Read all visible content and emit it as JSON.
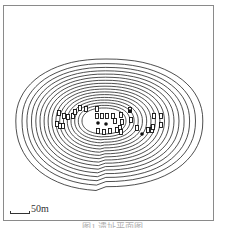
{
  "map": {
    "type": "contour-site-plan",
    "contour_color": "#222222",
    "contour_count": 17,
    "center": [
      104,
      121
    ],
    "outer_radius": [
      94,
      62
    ],
    "inner_radius": [
      22,
      13
    ],
    "markers": [
      {
        "x": 59,
        "y": 113
      },
      {
        "x": 64,
        "y": 116
      },
      {
        "x": 68,
        "y": 117
      },
      {
        "x": 73,
        "y": 116
      },
      {
        "x": 75,
        "y": 112
      },
      {
        "x": 80,
        "y": 108
      },
      {
        "x": 86,
        "y": 109
      },
      {
        "x": 57,
        "y": 124
      },
      {
        "x": 60,
        "y": 126
      },
      {
        "x": 63,
        "y": 126
      },
      {
        "x": 97,
        "y": 109
      },
      {
        "x": 97,
        "y": 116
      },
      {
        "x": 102,
        "y": 116
      },
      {
        "x": 107,
        "y": 116
      },
      {
        "x": 113,
        "y": 116
      },
      {
        "x": 115,
        "y": 121
      },
      {
        "x": 121,
        "y": 115
      },
      {
        "x": 122,
        "y": 122
      },
      {
        "x": 120,
        "y": 128
      },
      {
        "x": 130,
        "y": 110
      },
      {
        "x": 131,
        "y": 120
      },
      {
        "x": 98,
        "y": 131
      },
      {
        "x": 104,
        "y": 132
      },
      {
        "x": 110,
        "y": 131
      },
      {
        "x": 117,
        "y": 130
      },
      {
        "x": 121,
        "y": 132
      },
      {
        "x": 137,
        "y": 128
      },
      {
        "x": 148,
        "y": 130
      },
      {
        "x": 152,
        "y": 130
      },
      {
        "x": 154,
        "y": 116
      },
      {
        "x": 161,
        "y": 116
      },
      {
        "x": 161,
        "y": 125
      },
      {
        "x": 153,
        "y": 127
      }
    ],
    "dots": [
      {
        "x": 98,
        "y": 123
      },
      {
        "x": 106,
        "y": 124
      },
      {
        "x": 142,
        "y": 134
      },
      {
        "x": 130,
        "y": 111
      }
    ]
  },
  "scale_bar": {
    "label": "50m"
  },
  "caption": {
    "text": "图1 遗址平面图"
  }
}
